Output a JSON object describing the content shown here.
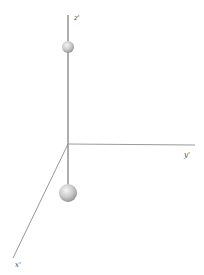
{
  "diagram": {
    "type": "3d-axes-with-spheres",
    "axes": [
      {
        "name": "z",
        "label": "z'",
        "direction": "up"
      },
      {
        "name": "y",
        "label": "y'",
        "direction": "right"
      },
      {
        "name": "x",
        "label": "x'",
        "direction": "down-left"
      }
    ],
    "spheres": [
      {
        "name": "upper-sphere",
        "position": "on z' axis above origin",
        "size": "small"
      },
      {
        "name": "lower-sphere",
        "position": "below origin on z' axis line",
        "size": "large"
      }
    ],
    "colors": {
      "background": "#ffffff",
      "axis": "#8a8a8a",
      "rod": "#9a9a9a",
      "sphere_highlight": "#f4f4f4",
      "sphere_mid": "#c8c8c8",
      "sphere_shadow": "#8c8c8c",
      "label": "#444444"
    }
  }
}
